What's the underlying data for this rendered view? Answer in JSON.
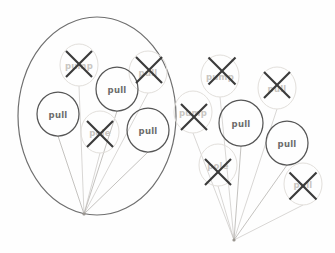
{
  "diagram": {
    "background_color": "#fefefe",
    "kept_node_color": "#565656",
    "faded_node_color": "#e2dfdb",
    "label_color": "#6b6b6b",
    "faded_label_color": "#c9c6c2",
    "edge_color": "#b9b6b2",
    "cross_color": "#3a3a3a",
    "hull_color": "#6f6f6f"
  },
  "clusters": [
    {
      "id": "left-cluster",
      "name": "enclosed-cluster",
      "has_hull": true,
      "hull": {
        "cx": 97,
        "cy": 116,
        "rx": 79,
        "ry": 99
      },
      "convergence": {
        "x": 84,
        "y": 214
      }
    },
    {
      "id": "right-cluster",
      "name": "open-cluster",
      "has_hull": false,
      "convergence": {
        "x": 234,
        "y": 240
      }
    }
  ],
  "nodes": [
    {
      "id": "l1",
      "label": "pump",
      "cluster": "left-cluster",
      "state": "removed",
      "cx": 79,
      "cy": 65,
      "rx": 19,
      "ry": 21
    },
    {
      "id": "l2",
      "label": "pull",
      "cluster": "left-cluster",
      "state": "removed",
      "cx": 148,
      "cy": 72,
      "rx": 19,
      "ry": 21
    },
    {
      "id": "l3",
      "label": "pull",
      "cluster": "left-cluster",
      "state": "kept",
      "cx": 117,
      "cy": 89,
      "rx": 21,
      "ry": 22
    },
    {
      "id": "l4",
      "label": "pull",
      "cluster": "left-cluster",
      "state": "kept",
      "cx": 58,
      "cy": 114,
      "rx": 21,
      "ry": 22
    },
    {
      "id": "l5",
      "label": "pole",
      "cluster": "left-cluster",
      "state": "removed",
      "cx": 100,
      "cy": 132,
      "rx": 19,
      "ry": 21
    },
    {
      "id": "l6",
      "label": "pull",
      "cluster": "left-cluster",
      "state": "kept",
      "cx": 148,
      "cy": 130,
      "rx": 21,
      "ry": 22
    },
    {
      "id": "r1",
      "label": "pump",
      "cluster": "right-cluster",
      "state": "removed",
      "cx": 220,
      "cy": 76,
      "rx": 19,
      "ry": 21
    },
    {
      "id": "r2",
      "label": "pull",
      "cluster": "right-cluster",
      "state": "removed",
      "cx": 277,
      "cy": 88,
      "rx": 19,
      "ry": 21
    },
    {
      "id": "r3",
      "label": "pump",
      "cluster": "right-cluster",
      "state": "removed",
      "cx": 193,
      "cy": 112,
      "rx": 19,
      "ry": 21
    },
    {
      "id": "r4",
      "label": "pull",
      "cluster": "right-cluster",
      "state": "kept",
      "cx": 241,
      "cy": 123,
      "rx": 22,
      "ry": 23
    },
    {
      "id": "r5",
      "label": "pull",
      "cluster": "right-cluster",
      "state": "kept",
      "cx": 287,
      "cy": 143,
      "rx": 21,
      "ry": 22
    },
    {
      "id": "r6",
      "label": "pole",
      "cluster": "right-cluster",
      "state": "removed",
      "cx": 218,
      "cy": 165,
      "rx": 19,
      "ry": 21
    },
    {
      "id": "r7",
      "label": "pull",
      "cluster": "right-cluster",
      "state": "removed",
      "cx": 303,
      "cy": 184,
      "rx": 19,
      "ry": 21
    }
  ],
  "edges": [
    {
      "from": "l1",
      "to": "convergence-left"
    },
    {
      "from": "l2",
      "to": "convergence-left"
    },
    {
      "from": "l3",
      "to": "convergence-left"
    },
    {
      "from": "l4",
      "to": "convergence-left"
    },
    {
      "from": "l5",
      "to": "convergence-left"
    },
    {
      "from": "l6",
      "to": "convergence-left"
    },
    {
      "from": "r1",
      "to": "convergence-right"
    },
    {
      "from": "r2",
      "to": "convergence-right"
    },
    {
      "from": "r3",
      "to": "convergence-right"
    },
    {
      "from": "r4",
      "to": "convergence-right"
    },
    {
      "from": "r5",
      "to": "convergence-right"
    },
    {
      "from": "r6",
      "to": "convergence-right"
    },
    {
      "from": "r7",
      "to": "convergence-right"
    }
  ],
  "crosses": [
    {
      "node": "l1",
      "cx": 79,
      "cy": 64,
      "size": 26
    },
    {
      "node": "l2",
      "cx": 149,
      "cy": 70,
      "size": 26
    },
    {
      "node": "l5",
      "cx": 100,
      "cy": 134,
      "size": 26
    },
    {
      "node": "r1",
      "cx": 222,
      "cy": 71,
      "size": 27
    },
    {
      "node": "r2",
      "cx": 277,
      "cy": 85,
      "size": 26
    },
    {
      "node": "r3",
      "cx": 194,
      "cy": 117,
      "size": 26
    },
    {
      "node": "r6",
      "cx": 218,
      "cy": 172,
      "size": 26
    },
    {
      "node": "r7",
      "cx": 303,
      "cy": 186,
      "size": 27
    }
  ]
}
